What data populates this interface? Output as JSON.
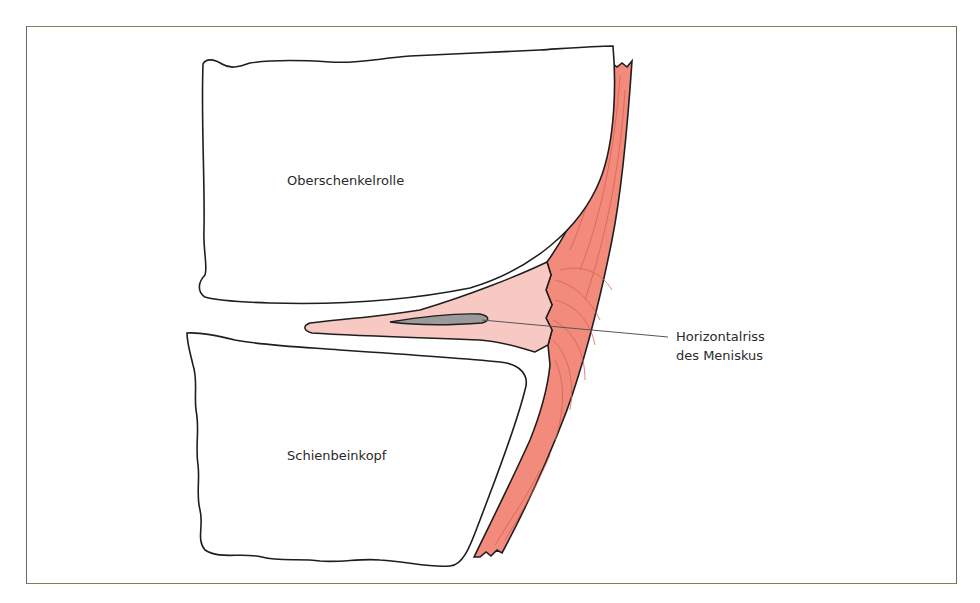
{
  "figure": {
    "labels": {
      "femur": "Oberschenkelrolle",
      "tibia": "Schienbeinkopf",
      "tear_line1": "Horizontalriss",
      "tear_line2": "des Meniskus"
    },
    "colors": {
      "frame": "#8a7a55",
      "outline": "#1e1e1e",
      "ligament": "#f28b7c",
      "ligament_fibers": "#d9604f",
      "meniscus": "#f8c9c3",
      "tear": "#9a9a9a",
      "background": "#ffffff"
    }
  }
}
